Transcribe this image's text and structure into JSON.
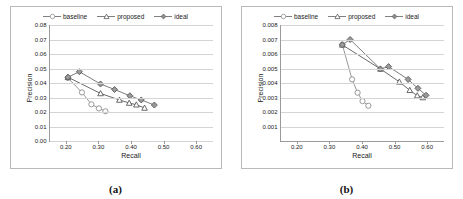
{
  "figure": {
    "panels": [
      {
        "caption": "(a)",
        "chart_data": {
          "type": "line",
          "title": "",
          "xlabel": "Recall",
          "ylabel": "Precision",
          "xlim": [
            0.15,
            0.65
          ],
          "ylim": [
            0.0,
            0.08
          ],
          "xticks": [
            "0.20",
            "0.30",
            "0.40",
            "0.50",
            "0.60"
          ],
          "xtick_values": [
            0.2,
            0.3,
            0.4,
            0.5,
            0.6
          ],
          "yticks": [
            "0.00",
            "0.01",
            "0.02",
            "0.03",
            "0.04",
            "0.05",
            "0.06",
            "0.07",
            "0.08"
          ],
          "ytick_values": [
            0.0,
            0.01,
            0.02,
            0.03,
            0.04,
            0.05,
            0.06,
            0.07,
            0.08
          ],
          "grid": "horizontal",
          "legend_position": "top-center",
          "series": [
            {
              "name": "baseline",
              "marker": "circle",
              "color": "#8c8c8c",
              "x": [
                0.205,
                0.248,
                0.277,
                0.3,
                0.32
              ],
              "y": [
                0.0435,
                0.0335,
                0.0253,
                0.0225,
                0.0205
              ]
            },
            {
              "name": "proposed",
              "marker": "triangle",
              "color": "#595959",
              "x": [
                0.205,
                0.305,
                0.363,
                0.393,
                0.415,
                0.44
              ],
              "y": [
                0.044,
                0.0328,
                0.0283,
                0.0262,
                0.025,
                0.0228
              ]
            },
            {
              "name": "ideal",
              "marker": "diamond",
              "color": "#6e6e6e",
              "x": [
                0.205,
                0.24,
                0.305,
                0.348,
                0.395,
                0.43,
                0.47
              ],
              "y": [
                0.044,
                0.0478,
                0.0393,
                0.0355,
                0.0312,
                0.0283,
                0.0248
              ]
            }
          ]
        }
      },
      {
        "caption": "(b)",
        "chart_data": {
          "type": "line",
          "title": "",
          "xlabel": "Recall",
          "ylabel": "Precision",
          "xlim": [
            0.15,
            0.65
          ],
          "ylim": [
            0.0,
            0.008
          ],
          "xticks": [
            "0.20",
            "0.30",
            "0.40",
            "0.50",
            "0.60"
          ],
          "xtick_values": [
            0.2,
            0.3,
            0.4,
            0.5,
            0.6
          ],
          "yticks": [
            "0.001",
            "0.002",
            "0.003",
            "0.004",
            "0.005",
            "0.006",
            "0.007",
            "0.008"
          ],
          "ytick_values": [
            0.001,
            0.002,
            0.003,
            0.004,
            0.005,
            0.006,
            0.007,
            0.008
          ],
          "grid": "horizontal",
          "legend_position": "top-center",
          "series": [
            {
              "name": "baseline",
              "marker": "circle",
              "color": "#8c8c8c",
              "x": [
                0.338,
                0.368,
                0.385,
                0.4,
                0.418
              ],
              "y": [
                0.00665,
                0.00425,
                0.00333,
                0.00275,
                0.00243
              ]
            },
            {
              "name": "proposed",
              "marker": "triangle",
              "color": "#595959",
              "x": [
                0.338,
                0.455,
                0.513,
                0.545,
                0.568,
                0.585
              ],
              "y": [
                0.00663,
                0.00497,
                0.00408,
                0.0035,
                0.00313,
                0.003
              ]
            },
            {
              "name": "ideal",
              "marker": "diamond",
              "color": "#6e6e6e",
              "x": [
                0.338,
                0.362,
                0.455,
                0.48,
                0.54,
                0.57,
                0.595
              ],
              "y": [
                0.00663,
                0.007,
                0.00497,
                0.00513,
                0.00425,
                0.00363,
                0.00315
              ]
            }
          ]
        }
      }
    ],
    "legend_labels": [
      "baseline",
      "proposed",
      "ideal"
    ]
  }
}
